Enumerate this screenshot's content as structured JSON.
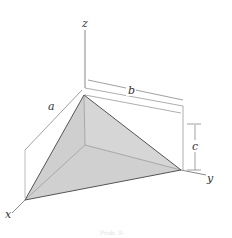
{
  "diagram": {
    "type": "tetrahedron-3d",
    "axes": {
      "x": "x",
      "y": "y",
      "z": "z"
    },
    "dimensions": {
      "a": "a",
      "b": "b",
      "c": "c"
    },
    "caption": "Prob. 9–"
  },
  "colors": {
    "face": "#d2d2d2",
    "edge": "#555555",
    "guide": "#888888"
  }
}
